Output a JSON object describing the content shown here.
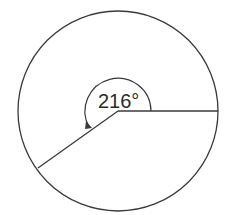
{
  "diagram": {
    "type": "circle-sector",
    "angle_label": "216°",
    "angle_degrees": 216,
    "stroke_color": "#3a3a3a",
    "background": "#ffffff"
  }
}
